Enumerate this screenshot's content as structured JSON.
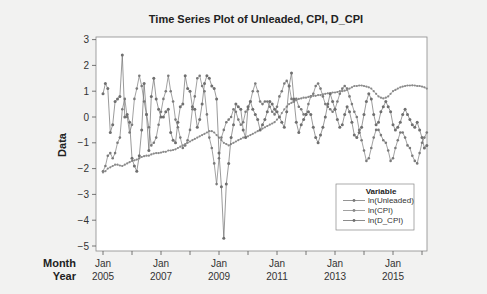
{
  "chart_data": {
    "type": "line",
    "title": "Time Series Plot of Unleaded, CPI, D_CPI",
    "xlabel": "",
    "ylabel": "Data",
    "x_axis_row_labels": [
      "Month",
      "Year"
    ],
    "x_ticks": [
      {
        "month": "Jan",
        "year": "2005"
      },
      {
        "month": "Jan",
        "year": "2007"
      },
      {
        "month": "Jan",
        "year": "2009"
      },
      {
        "month": "Jan",
        "year": "2011"
      },
      {
        "month": "Jan",
        "year": "2013"
      },
      {
        "month": "Jan",
        "year": "2015"
      }
    ],
    "y_ticks": [
      3,
      2,
      1,
      0,
      -1,
      -2,
      -3,
      -4,
      -5
    ],
    "ylim": [
      -5,
      3
    ],
    "xlim": [
      "2005-01",
      "2016-03"
    ],
    "grid": false,
    "legend": {
      "title": "Variable",
      "position": "lower right inside",
      "entries": [
        "ln(Unleaded)",
        "ln(CPI)",
        "ln(D_CPI)"
      ]
    },
    "x_start": "2005-01",
    "x_frequency": "monthly",
    "series": [
      {
        "name": "ln(Unleaded)",
        "values": [
          -2.1,
          -1.9,
          -1.5,
          -1.4,
          -1.6,
          -1.4,
          -1.0,
          -0.8,
          0.3,
          0.7,
          0.0,
          -0.6,
          -0.3,
          0.7,
          1.1,
          1.6,
          1.2,
          0.6,
          0.1,
          -0.4,
          -1.1,
          -1.0,
          -0.8,
          -0.3,
          0.2,
          0.7,
          1.0,
          1.6,
          1.0,
          0.6,
          -0.1,
          -0.4,
          -0.8,
          -1.2,
          -1.1,
          -0.9,
          -0.5,
          0.3,
          0.8,
          1.5,
          1.6,
          1.2,
          1.0,
          0.1,
          -0.8,
          -1.2,
          -1.8,
          -2.6,
          -1.6,
          -0.8,
          -0.5,
          -0.2,
          -0.1,
          0.0,
          0.3,
          0.2,
          -0.1,
          -0.3,
          -0.2,
          0.2,
          0.3,
          0.6,
          1.0,
          1.3,
          1.0,
          0.6,
          0.5,
          0.6,
          0.6,
          0.4,
          0.2,
          0.1,
          0.4,
          0.8,
          1.0,
          1.3,
          1.4,
          1.2,
          0.7,
          0.6,
          0.7,
          0.4,
          0.3,
          0.1,
          0.1,
          0.5,
          0.8,
          0.9,
          1.2,
          1.3,
          1.1,
          0.8,
          0.5,
          0.4,
          0.3,
          0.2,
          0.3,
          0.6,
          0.9,
          1.1,
          1.2,
          1.1,
          0.8,
          0.5,
          0.2,
          0.0,
          -0.5,
          -0.9,
          -1.3,
          -1.7,
          -1.6,
          -1.2,
          -0.8,
          -0.5,
          -0.5,
          -0.7,
          -0.9,
          -1.0,
          -1.3,
          -1.7,
          -1.6,
          -1.2,
          -0.9,
          -0.6,
          -0.6,
          -0.8,
          -1.1,
          -1.2,
          -1.5,
          -1.7,
          -1.8,
          -1.4,
          -1.0,
          -0.8,
          -0.6
        ]
      },
      {
        "name": "ln(CPI)",
        "values": [
          -2.15,
          -2.1,
          -2.0,
          -1.95,
          -1.9,
          -1.85,
          -1.85,
          -1.88,
          -1.9,
          -1.85,
          -1.8,
          -1.75,
          -1.7,
          -1.68,
          -1.65,
          -1.6,
          -1.55,
          -1.52,
          -1.5,
          -1.5,
          -1.45,
          -1.42,
          -1.4,
          -1.4,
          -1.38,
          -1.35,
          -1.35,
          -1.3,
          -1.3,
          -1.28,
          -1.25,
          -1.2,
          -1.15,
          -1.1,
          -1.05,
          -1.0,
          -0.95,
          -0.9,
          -0.85,
          -0.8,
          -0.75,
          -0.7,
          -0.65,
          -0.6,
          -0.55,
          -0.55,
          -0.6,
          -0.7,
          -0.8,
          -0.9,
          -1.0,
          -1.05,
          -1.1,
          -1.05,
          -1.0,
          -0.95,
          -0.9,
          -0.85,
          -0.8,
          -0.78,
          -0.75,
          -0.7,
          -0.65,
          -0.6,
          -0.55,
          -0.5,
          -0.45,
          -0.4,
          -0.35,
          -0.3,
          -0.25,
          -0.2,
          -0.1,
          0.0,
          0.15,
          0.3,
          0.4,
          0.5,
          0.55,
          0.6,
          0.65,
          0.7,
          0.72,
          0.75,
          0.75,
          0.78,
          0.8,
          0.82,
          0.82,
          0.85,
          0.85,
          0.88,
          0.9,
          0.92,
          0.92,
          0.95,
          0.95,
          0.97,
          1.0,
          1.0,
          1.02,
          1.05,
          1.1,
          1.15,
          1.2,
          1.2,
          1.22,
          1.22,
          1.2,
          1.18,
          1.15,
          1.1,
          1.0,
          0.9,
          0.8,
          0.75,
          0.72,
          0.75,
          0.8,
          0.9,
          1.0,
          1.05,
          1.1,
          1.15,
          1.18,
          1.2,
          1.22,
          1.22,
          1.23,
          1.22,
          1.2,
          1.2,
          1.18,
          1.15,
          1.1
        ]
      },
      {
        "name": "ln(D_CPI)",
        "values": [
          0.9,
          1.3,
          1.1,
          -0.6,
          -0.3,
          0.6,
          0.7,
          0.8,
          2.4,
          0.0,
          0.1,
          -0.2,
          -1.6,
          -1.9,
          -2.1,
          -1.5,
          -0.5,
          1.3,
          0.1,
          -1.3,
          0.8,
          1.5,
          0.7,
          0.3,
          0.0,
          0.0,
          0.2,
          0.3,
          -0.6,
          -0.9,
          -1.0,
          -0.2,
          0.4,
          0.5,
          1.6,
          1.1,
          1.0,
          0.4,
          0.3,
          -0.4,
          -0.1,
          0.5,
          1.3,
          1.6,
          1.5,
          1.2,
          1.1,
          0.7,
          -1.4,
          -2.7,
          -4.7,
          -2.6,
          -1.8,
          -0.8,
          -0.3,
          0.5,
          0.4,
          0.3,
          -0.5,
          -0.8,
          0.4,
          0.6,
          0.3,
          0.1,
          -0.1,
          -0.5,
          -0.3,
          -0.1,
          0.2,
          0.6,
          0.5,
          0.3,
          0.2,
          0.0,
          -0.2,
          -0.4,
          0.2,
          1.2,
          1.7,
          0.7,
          -0.2,
          -0.6,
          -0.3,
          -0.1,
          0.1,
          0.2,
          0.1,
          -0.4,
          -0.8,
          -1.0,
          -0.7,
          -0.4,
          0.0,
          0.5,
          0.9,
          0.6,
          0.3,
          -0.1,
          -0.4,
          -0.3,
          0.1,
          0.4,
          0.2,
          -0.2,
          -0.7,
          -0.8,
          -0.6,
          -0.4,
          0.1,
          0.6,
          0.9,
          0.7,
          0.1,
          -0.3,
          -0.2,
          0.2,
          0.4,
          0.6,
          0.4,
          0.2,
          -0.3,
          -0.5,
          -0.4,
          -0.2,
          0.1,
          0.3,
          0.1,
          -0.1,
          -0.3,
          -0.4,
          -0.2,
          -0.5,
          -0.8,
          -1.2,
          -1.1
        ]
      }
    ]
  }
}
